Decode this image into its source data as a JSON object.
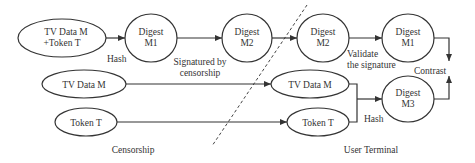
{
  "diagram": {
    "type": "flowchart",
    "regions": {
      "left": "Censorship",
      "right": "User Terminal"
    },
    "nodes": {
      "tv_token": {
        "line1": "TV Data M",
        "line2": "+Token T"
      },
      "digest_m1": {
        "line1": "Digest",
        "line2": "M1"
      },
      "digest_m2": {
        "line1": "Digest",
        "line2": "M2"
      },
      "ut_digest_m2": {
        "line1": "Digest",
        "line2": "M2"
      },
      "ut_digest_m1": {
        "line1": "Digest",
        "line2": "M1"
      },
      "tv_data": {
        "label": "TV Data M"
      },
      "token": {
        "label": "Token T"
      },
      "ut_tv_data": {
        "label": "TV Data M"
      },
      "ut_token": {
        "label": "Token T"
      },
      "digest_m3": {
        "line1": "Digest",
        "line2": "M3"
      }
    },
    "edge_labels": {
      "hash_top": "Hash",
      "signatured_line1": "Signatured by",
      "signatured_line2": "censorship",
      "validate_line1": "Validate",
      "validate_line2": "the signature",
      "contrast": "Contrast",
      "hash_bottom": "Hash"
    },
    "edges": [
      {
        "from": "tv_token",
        "to": "digest_m1",
        "label": "Hash"
      },
      {
        "from": "digest_m1",
        "to": "digest_m2",
        "label": "Signatured by censorship"
      },
      {
        "from": "digest_m2",
        "to": "ut_digest_m2",
        "label": ""
      },
      {
        "from": "ut_digest_m2",
        "to": "ut_digest_m1",
        "label": "Validate the signature"
      },
      {
        "from": "tv_data",
        "to": "ut_tv_data",
        "label": ""
      },
      {
        "from": "token",
        "to": "ut_token",
        "label": ""
      },
      {
        "from": "ut_tv_data",
        "to": "digest_m3",
        "label": "Hash"
      },
      {
        "from": "ut_token",
        "to": "digest_m3",
        "label": "Hash"
      },
      {
        "from": "ut_digest_m1",
        "to": "contrast",
        "label": "Contrast"
      },
      {
        "from": "digest_m3",
        "to": "contrast",
        "label": "Contrast"
      }
    ]
  }
}
